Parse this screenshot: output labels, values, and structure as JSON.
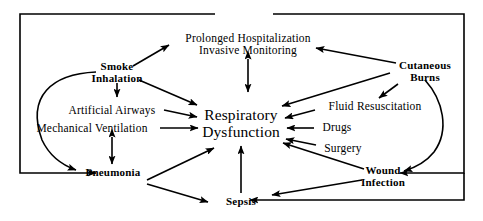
{
  "diagram": {
    "stroke_color": "#000000",
    "background_color": "#ffffff",
    "nodes": {
      "prolonged_hospitalization": {
        "line1": "Prolonged  Hospitalization",
        "line2": "Invasive  Monitoring"
      },
      "smoke_inhalation": {
        "line1": "Smoke",
        "line2": "Inhalation"
      },
      "artificial_airways": {
        "line1": "Artificial  Airways"
      },
      "mechanical_ventilation": {
        "line1": "Mechanical  Ventilation"
      },
      "pneumonia": {
        "line1": "Pneumonia"
      },
      "respiratory_dysfunction": {
        "line1": "Respiratory",
        "line2": "Dysfunction"
      },
      "sepsis": {
        "line1": "Sepsis"
      },
      "cutaneous_burns": {
        "line1": "Cutaneous",
        "line2": "Burns"
      },
      "fluid_resuscitation": {
        "line1": "Fluid  Resuscitation"
      },
      "drugs": {
        "line1": "Drugs"
      },
      "surgery": {
        "line1": "Surgery"
      },
      "wound_infection": {
        "line1": "Wound",
        "line2": "Infection"
      }
    }
  }
}
